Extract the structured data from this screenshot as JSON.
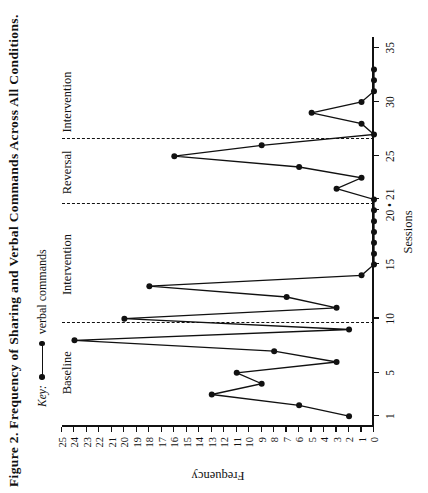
{
  "figure": {
    "title": "Figure 2. Frequency of Sharing and Verbal Commands Across All Conditions.",
    "key_label": "Key:",
    "key_series_name": "verbal commands"
  },
  "chart_data": {
    "type": "line",
    "title": "Figure 2. Frequency of Sharing and Verbal Commands Across All Conditions.",
    "xlabel": "Sessions",
    "ylabel": "Frequency",
    "xlim": [
      0,
      36
    ],
    "ylim": [
      0,
      25
    ],
    "grid": false,
    "legend_position": "top-left",
    "x_ticks": [
      1,
      5,
      10,
      15,
      20,
      21,
      25,
      30,
      35
    ],
    "x_tick_labels": [
      "1",
      "5",
      "10",
      "15",
      "20",
      "21",
      "25",
      "30",
      "35"
    ],
    "x_tick_label_20_21": "20 • 21",
    "y_ticks": [
      0,
      1,
      2,
      3,
      4,
      5,
      6,
      7,
      8,
      9,
      10,
      11,
      12,
      13,
      14,
      15,
      16,
      17,
      18,
      19,
      20,
      21,
      22,
      23,
      24,
      25
    ],
    "y_tick_labels": [
      "0",
      "1",
      "2",
      "3",
      "4",
      "5",
      "6",
      "7",
      "8",
      "9",
      "10",
      "11",
      "12",
      "13",
      "14",
      "15",
      "16",
      "17",
      "18",
      "19",
      "20",
      "21",
      "22",
      "23",
      "24",
      "25"
    ],
    "series": [
      {
        "name": "verbal commands",
        "marker": "filled-circle",
        "color": "#111111",
        "x": [
          1,
          2,
          3,
          4,
          5,
          6,
          7,
          8,
          9,
          10,
          11,
          12,
          13,
          14,
          15,
          16,
          17,
          18,
          19,
          20,
          21,
          22,
          23,
          24,
          25,
          26,
          27,
          28,
          29,
          30,
          31,
          32,
          33
        ],
        "values": [
          2,
          6,
          13,
          9,
          11,
          3,
          8,
          24,
          2,
          20,
          3,
          7,
          18,
          1,
          0,
          0,
          0,
          0,
          0,
          0,
          0,
          3,
          1,
          6,
          16,
          9,
          0,
          1,
          5,
          1,
          0,
          0,
          0
        ]
      }
    ],
    "phases": [
      {
        "label": "Baseline",
        "x_start": 1,
        "x_end": 9
      },
      {
        "label": "Intervention",
        "x_start": 10,
        "x_end": 20
      },
      {
        "label": "Reversal",
        "x_start": 21,
        "x_end": 26
      },
      {
        "label": "Intervention",
        "x_start": 27,
        "x_end": 33
      }
    ],
    "phase_dividers_x": [
      9.6,
      20.6,
      26.6
    ],
    "annotations": []
  }
}
